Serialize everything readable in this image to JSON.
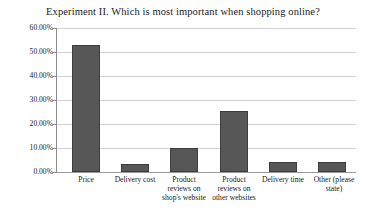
{
  "chart_data": {
    "type": "bar",
    "title": "Experiment II. Which is most important when shopping online?",
    "xlabel": "",
    "ylabel": "",
    "categories": [
      "Price",
      "Delivery cost",
      "Product reviews on shop's website",
      "Product reviews on other websites",
      "Delivery time",
      "Other (please state)"
    ],
    "category_lines": [
      [
        "Price"
      ],
      [
        "Delivery cost"
      ],
      [
        "Product",
        "reviews on",
        "shop's website"
      ],
      [
        "Product",
        "reviews on",
        "other websites"
      ],
      [
        "Delivery time"
      ],
      [
        "Other (please",
        "state)"
      ]
    ],
    "values": [
      52.8,
      3.3,
      10.0,
      25.5,
      4.1,
      4.1
    ],
    "value_labels": [
      "52.80%",
      "3.30%",
      "10.00%",
      "25.50%",
      "4.10%",
      "4.10%"
    ],
    "ylim": [
      0,
      60
    ],
    "ytick_values": [
      0,
      10,
      20,
      30,
      40,
      50,
      60
    ],
    "ytick_labels": [
      "0.00%",
      "10.00%",
      "20.00%",
      "30.00%",
      "40.00%",
      "50.00%",
      "60.00%"
    ],
    "grid": true,
    "legend": false,
    "legend_position": "none",
    "bar_color": "#575757",
    "bar_edge_color": "#3d3d3d",
    "gridline_color": "#d2d2d2",
    "axis_color": "#8c8c8c",
    "background_color": "#ffffff"
  }
}
